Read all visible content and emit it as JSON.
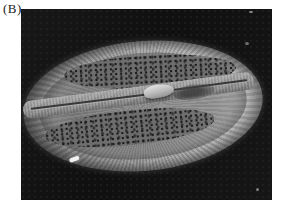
{
  "figure": {
    "panel_label": "(B)",
    "photo": {
      "name": "sem-micrograph-diatom",
      "type": "scanning-electron-micrograph",
      "background_color": "#121212",
      "specimen": {
        "shape": "ellipse",
        "features": [
          "ribbed-rim",
          "upper-pore-field",
          "lower-pore-field",
          "sternum-band",
          "raphe-slit",
          "central-nodule",
          "rim-highlight"
        ],
        "colors": {
          "rim": "#a2a2a2",
          "valve_face": "#8a8a8a",
          "pore_field": "#4a4a4a",
          "sternum": "#a6a6a6",
          "nodule_highlight": "#dedede",
          "raphe": "#383838",
          "bright_speck": "#f2f2f2"
        }
      }
    }
  }
}
